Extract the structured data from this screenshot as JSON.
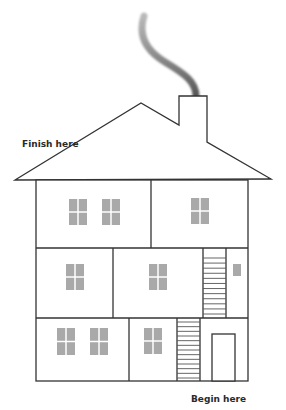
{
  "labels": {
    "finish": "Finish here",
    "begin": "Begin here"
  },
  "colors": {
    "outline": "#333333",
    "window": "#a9a9a9",
    "smoke": "#666666",
    "background": "#ffffff"
  },
  "house": {
    "floors": 3,
    "floor_names": [
      "attic-upper-floor",
      "middle-floor",
      "ground-floor"
    ],
    "stairs": [
      {
        "between": "ground-floor to middle-floor",
        "rungs": 13
      },
      {
        "between": "middle-floor to upper-floor",
        "rungs": 12
      }
    ],
    "windows": {
      "upper-floor": 3,
      "middle-floor": 3,
      "ground-floor": 3
    },
    "has_door": true,
    "has_chimney": true,
    "has_smoke": true
  }
}
